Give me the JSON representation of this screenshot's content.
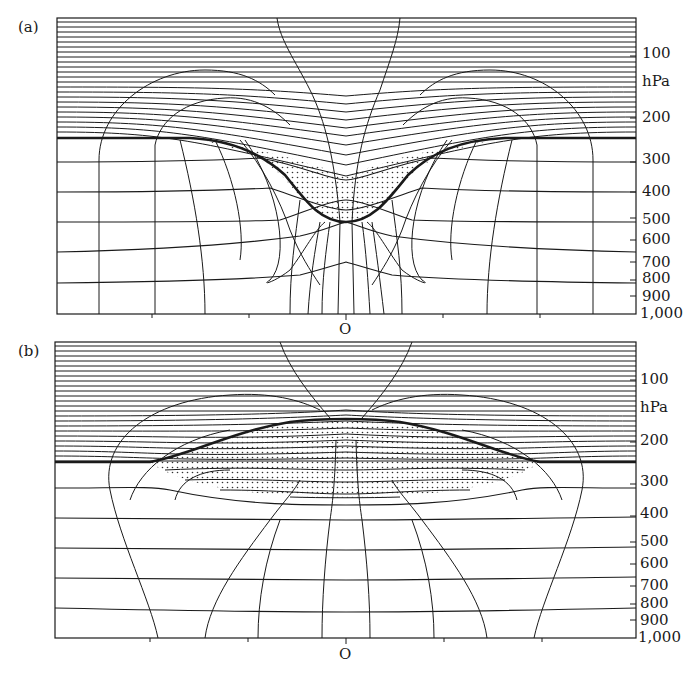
{
  "figure": {
    "panels": [
      {
        "id": "a",
        "label": "(a)",
        "origin_label": "O",
        "description": "Tropopause folding downward (depression) with stippled stratospheric air intrusion centered at O",
        "pressure_axis": {
          "unit": "hPa",
          "ticks": [
            "100",
            "200",
            "300",
            "400",
            "500",
            "600",
            "700",
            "800",
            "900",
            "1,000"
          ]
        }
      },
      {
        "id": "b",
        "label": "(b)",
        "origin_label": "O",
        "description": "Tropopause raised upward (dome) with stippled tropospheric air lens centered at O",
        "pressure_axis": {
          "unit": "hPa",
          "ticks": [
            "100",
            "200",
            "300",
            "400",
            "500",
            "600",
            "700",
            "800",
            "900",
            "1,000"
          ]
        }
      }
    ],
    "colors": {
      "line": "#1a1a1a",
      "background": "#ffffff",
      "stipple": "#333333"
    }
  }
}
